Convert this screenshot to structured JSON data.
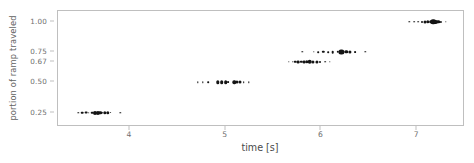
{
  "chart_data": {
    "type": "scatter",
    "title": "",
    "xlabel": "time [s]",
    "ylabel": "portion of ramp traveled",
    "xlim": [
      3.25,
      7.5
    ],
    "ylim": [
      0.13,
      1.09
    ],
    "grid": false,
    "legend": null,
    "xticks": [
      4,
      5,
      6,
      7
    ],
    "xtick_labels": [
      "4",
      "5",
      "6",
      "7"
    ],
    "yticks": [
      0.25,
      0.5,
      0.67,
      0.75,
      1.0
    ],
    "ytick_labels": [
      "0.25",
      "0.50",
      "0.67",
      "0.75",
      "1.00"
    ],
    "marker_color": "#141414",
    "axes_color": "#bfbfbf",
    "tick_label_color": "#6e6e6e",
    "series": [
      {
        "name": "0.25",
        "y": 0.25,
        "x": [
          3.46,
          3.5,
          3.54,
          3.57,
          3.61,
          3.64,
          3.67,
          3.69,
          3.71,
          3.74,
          3.77,
          3.8,
          3.9
        ],
        "sizes": [
          1.4,
          2.6,
          2.8,
          1.6,
          2.6,
          4.0,
          4.2,
          3.6,
          2.4,
          3.4,
          3.4,
          1.8,
          1.4
        ]
      },
      {
        "name": "0.50",
        "y": 0.5,
        "x": [
          4.71,
          4.76,
          4.82,
          4.92,
          4.96,
          5.0,
          5.03,
          5.09,
          5.12,
          5.15,
          5.19,
          5.24
        ],
        "sizes": [
          1.4,
          1.4,
          1.6,
          3.4,
          3.6,
          3.6,
          1.8,
          3.4,
          3.2,
          3.0,
          1.6,
          1.4
        ]
      },
      {
        "name": "0.67",
        "y": 0.67,
        "x": [
          5.66,
          5.7,
          5.73,
          5.76,
          5.79,
          5.82,
          5.85,
          5.88,
          5.91,
          5.95,
          5.99,
          6.04,
          6.09
        ],
        "sizes": [
          1.4,
          1.6,
          2.6,
          2.8,
          2.4,
          2.8,
          3.4,
          4.6,
          3.2,
          3.2,
          2.0,
          1.6,
          1.4
        ]
      },
      {
        "name": "0.75",
        "y": 0.75,
        "x": [
          5.8,
          5.92,
          5.97,
          6.02,
          6.07,
          6.12,
          6.17,
          6.21,
          6.26,
          6.3,
          6.35,
          6.46
        ],
        "sizes": [
          1.4,
          1.4,
          1.6,
          2.4,
          1.6,
          2.6,
          2.4,
          5.2,
          3.4,
          3.2,
          1.8,
          1.4
        ]
      },
      {
        "name": "1.00",
        "y": 1.0,
        "x": [
          6.92,
          6.97,
          7.01,
          7.05,
          7.08,
          7.11,
          7.14,
          7.17,
          7.19,
          7.22,
          7.25,
          7.3
        ],
        "sizes": [
          1.4,
          1.6,
          1.6,
          2.0,
          3.0,
          3.4,
          3.6,
          5.4,
          4.2,
          3.4,
          2.2,
          1.4
        ]
      }
    ]
  }
}
